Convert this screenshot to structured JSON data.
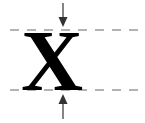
{
  "diagram": {
    "glyph": "X",
    "colors": {
      "glyph": "#000000",
      "guide_line": "#9a9a9a",
      "arrow": "#333333",
      "background": "#ffffff"
    },
    "guides": [
      {
        "name": "top-guide",
        "style": "dashed"
      },
      {
        "name": "baseline-guide",
        "style": "dashed"
      }
    ],
    "arrows": [
      {
        "name": "top-arrow",
        "direction": "down"
      },
      {
        "name": "bottom-arrow",
        "direction": "up"
      }
    ]
  }
}
